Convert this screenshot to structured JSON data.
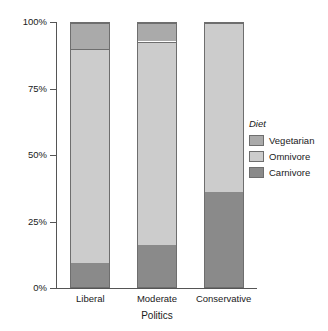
{
  "chart_data": {
    "type": "bar",
    "subtype": "stacked-percent",
    "title": "",
    "xlabel": "Politics",
    "ylabel": "Percent",
    "categories": [
      "Liberal",
      "Moderate",
      "Conservative"
    ],
    "series": [
      {
        "name": "Vegetarian",
        "values": [
          10,
          7,
          0
        ],
        "color": "#aaaaaa"
      },
      {
        "name": "Omnivore",
        "values": [
          81,
          77,
          64
        ],
        "color": "#cccccc"
      },
      {
        "name": "Carnivore",
        "values": [
          9,
          16,
          36
        ],
        "color": "#8a8a8a"
      }
    ],
    "stack_order_bottom_to_top": [
      "Carnivore",
      "Omnivore",
      "Vegetarian"
    ],
    "ylim": [
      0,
      100
    ],
    "ytick_labels": [
      "0%",
      "25%",
      "50%",
      "75%",
      "100%"
    ],
    "ytick_values": [
      0,
      25,
      50,
      75,
      100
    ],
    "grid": false,
    "legend_position": "right",
    "legend_title": "Diet",
    "bar_border_color": "#6e6e6e",
    "axis_color": "#555555",
    "background_color": "#ffffff"
  },
  "axes": {
    "y_title": "Percent",
    "x_title": "Politics",
    "y_ticks": [
      {
        "label": "100%",
        "value": 100
      },
      {
        "label": "75%",
        "value": 75
      },
      {
        "label": "50%",
        "value": 50
      },
      {
        "label": "25%",
        "value": 25
      },
      {
        "label": "0%",
        "value": 0
      }
    ],
    "x_ticks": [
      {
        "label": "Liberal"
      },
      {
        "label": "Moderate"
      },
      {
        "label": "Conservative"
      }
    ]
  },
  "legend": {
    "title": "Diet",
    "items": [
      {
        "label": "Vegetarian",
        "color": "#aaaaaa"
      },
      {
        "label": "Omnivore",
        "color": "#cccccc"
      },
      {
        "label": "Carnivore",
        "color": "#8a8a8a"
      }
    ]
  }
}
